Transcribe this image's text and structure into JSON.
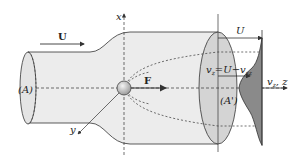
{
  "diagram": {
    "type": "flow past particle in stream tube (wake / drag force)",
    "labels": {
      "flow_velocity": "U",
      "axis_x": "x",
      "axis_y": "y",
      "force": "F",
      "inlet_surface": "(A)",
      "outlet_surface": "(A')",
      "profile_velocity_top": "U",
      "wake_relation": "v_z = U − v_sz",
      "wake_relation_parts": {
        "lhs": "v",
        "lhs_sub": "z",
        "eq": "=U−v",
        "rhs_sub": "sz"
      },
      "axis_z": "v_z, z",
      "axis_z_parts": {
        "v": "v",
        "sub": "z",
        "rest": ", z"
      }
    },
    "colors": {
      "tube_fill": "#ececec",
      "outlet_fill": "#d4d4d4",
      "wake_profile_fill": "#8a8a8a",
      "stroke": "#333333",
      "particle_fill": "#c8c8c8"
    }
  }
}
